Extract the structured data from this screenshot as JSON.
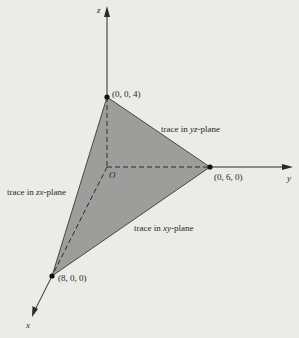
{
  "diagram": {
    "type": "3d-plane-traces",
    "colors": {
      "background": "#ebebe8",
      "plane_fill": "#9d9d9b",
      "line": "#2a2a2a"
    },
    "axes": {
      "x_label": "x",
      "y_label": "y",
      "z_label": "z",
      "origin_label": "O"
    },
    "points": [
      {
        "id": "z_intercept",
        "label": "(0, 0, 4)"
      },
      {
        "id": "y_intercept",
        "label": "(0, 6, 0)"
      },
      {
        "id": "x_intercept",
        "label": "(8, 0, 0)"
      }
    ],
    "traces": [
      {
        "id": "yz",
        "prefix": "trace in ",
        "plane": "yz",
        "suffix": "-plane"
      },
      {
        "id": "zx",
        "prefix": "trace in ",
        "plane": "zx",
        "suffix": "-plane"
      },
      {
        "id": "xy",
        "prefix": "trace in ",
        "plane": "xy",
        "suffix": "-plane"
      }
    ]
  }
}
